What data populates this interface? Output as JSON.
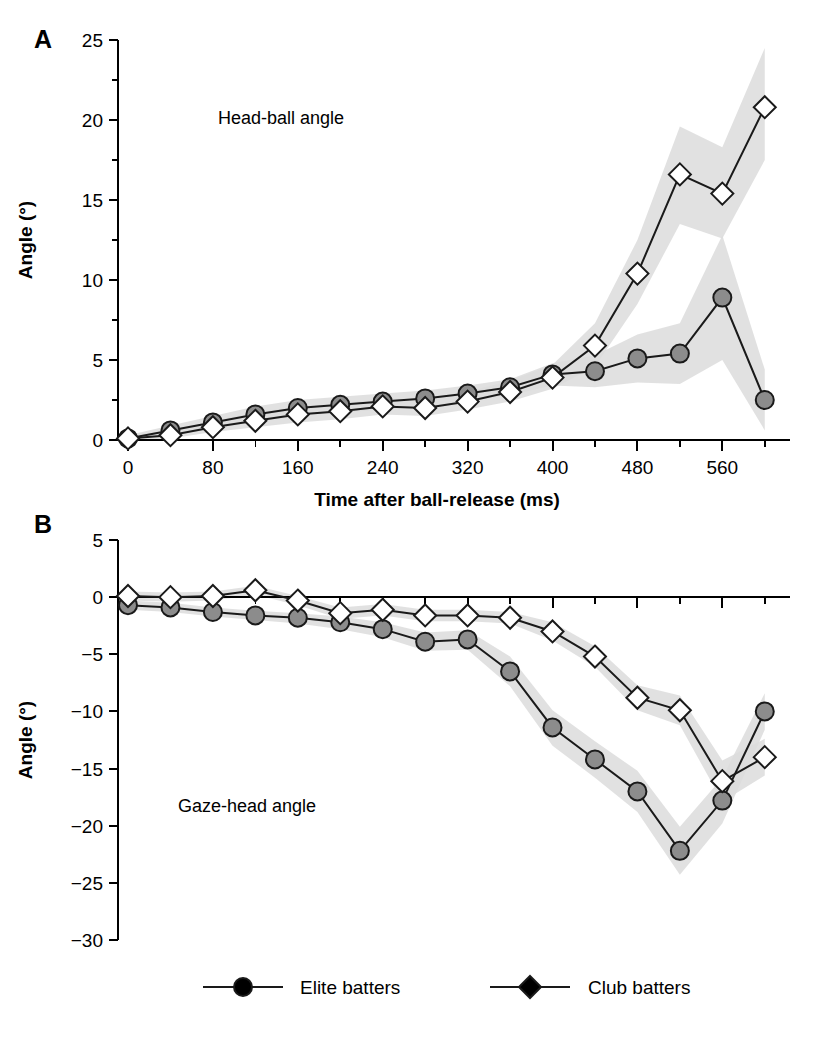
{
  "figure": {
    "panels": [
      {
        "letter": "A",
        "annotation": "Head-ball angle",
        "ylabel": "Angle (°)"
      },
      {
        "letter": "B",
        "annotation": "Gaze-head angle",
        "ylabel": "Angle (°)"
      }
    ],
    "xlabel": "Time after ball-release (ms)",
    "legend": [
      {
        "label": "Elite batters",
        "marker": "filled-circle",
        "color": "#8c8c8c"
      },
      {
        "label": "Club batters",
        "marker": "open-diamond",
        "color": "#ffffff"
      }
    ],
    "colors": {
      "line": "#1a1a1a",
      "elite_fill": "#8c8c8c",
      "club_fill": "#ffffff",
      "band": "#dcdcdc",
      "text": "#000000"
    }
  },
  "chart_data": [
    {
      "type": "line",
      "panel": "A",
      "title": "Head-ball angle",
      "xlabel": "Time after ball-release (ms)",
      "ylabel": "Angle (°)",
      "xlim": [
        0,
        620
      ],
      "ylim": [
        0,
        25
      ],
      "xticks": [
        0,
        80,
        160,
        240,
        320,
        400,
        480,
        560
      ],
      "xtick_labels": [
        "0",
        "80",
        "160",
        "240",
        "320",
        "400",
        "480",
        "560"
      ],
      "xtick_minor_step": 40,
      "yticks": [
        0,
        5,
        10,
        15,
        20,
        25
      ],
      "ytick_labels": [
        "0",
        "5",
        "10",
        "15",
        "20",
        "25"
      ],
      "ytick_minor_step": 2.5,
      "grid": false,
      "legend_position": "bottom-outside",
      "x": [
        0,
        40,
        80,
        120,
        160,
        200,
        240,
        280,
        320,
        360,
        400,
        440,
        480,
        520,
        560,
        600
      ],
      "series": [
        {
          "name": "Elite batters",
          "marker": "filled-circle",
          "values": [
            0.1,
            0.6,
            1.1,
            1.6,
            2.0,
            2.2,
            2.4,
            2.6,
            2.9,
            3.3,
            4.1,
            4.3,
            5.1,
            5.4,
            8.9,
            2.5
          ],
          "band_lower": [
            0.0,
            0.3,
            0.7,
            1.1,
            1.5,
            1.7,
            1.9,
            2.1,
            2.4,
            2.8,
            3.4,
            3.3,
            3.6,
            3.5,
            5.0,
            0.6
          ],
          "band_upper": [
            0.3,
            0.9,
            1.5,
            2.1,
            2.5,
            2.7,
            2.9,
            3.1,
            3.4,
            3.8,
            4.8,
            5.3,
            6.6,
            7.3,
            12.8,
            4.4
          ]
        },
        {
          "name": "Club batters",
          "marker": "open-diamond",
          "values": [
            0.1,
            0.3,
            0.8,
            1.2,
            1.6,
            1.8,
            2.1,
            2.0,
            2.4,
            3.0,
            3.9,
            5.9,
            10.4,
            16.6,
            15.4,
            20.8
          ],
          "band_lower": [
            0.0,
            0.1,
            0.5,
            0.8,
            1.1,
            1.3,
            1.6,
            1.5,
            1.9,
            2.4,
            3.2,
            4.6,
            8.5,
            13.5,
            12.6,
            17.5
          ],
          "band_upper": [
            0.3,
            0.6,
            1.2,
            1.7,
            2.1,
            2.3,
            2.6,
            2.6,
            3.0,
            3.7,
            4.7,
            7.3,
            12.5,
            19.6,
            18.3,
            24.5
          ]
        }
      ]
    },
    {
      "type": "line",
      "panel": "B",
      "title": "Gaze-head angle",
      "xlabel": "Time after ball-release (ms)",
      "ylabel": "Angle (°)",
      "xlim": [
        0,
        620
      ],
      "ylim": [
        -30,
        5
      ],
      "xticks": [
        0,
        80,
        160,
        240,
        320,
        400,
        480,
        560
      ],
      "xtick_labels": [
        "0",
        "80",
        "160",
        "240",
        "320",
        "400",
        "480",
        "560"
      ],
      "xtick_minor_step": 40,
      "yticks": [
        5,
        0,
        -5,
        -10,
        -15,
        -20,
        -25,
        -30
      ],
      "ytick_labels": [
        "5",
        "0",
        "−5",
        "−10",
        "−15",
        "−20",
        "−25",
        "−30"
      ],
      "grid": false,
      "legend_position": "bottom-outside",
      "x": [
        0,
        40,
        80,
        120,
        160,
        200,
        240,
        280,
        320,
        360,
        400,
        440,
        480,
        520,
        560,
        600
      ],
      "series": [
        {
          "name": "Elite batters",
          "marker": "filled-circle",
          "values": [
            -0.7,
            -0.9,
            -1.3,
            -1.6,
            -1.8,
            -2.2,
            -2.8,
            -3.9,
            -3.7,
            -6.5,
            -11.4,
            -14.2,
            -17.0,
            -22.2,
            -17.8,
            -10.0
          ],
          "band_lower": [
            -1.1,
            -1.3,
            -1.7,
            -2.0,
            -2.3,
            -2.8,
            -3.5,
            -4.7,
            -4.6,
            -7.8,
            -13.0,
            -15.8,
            -18.8,
            -24.3,
            -19.8,
            -11.6
          ],
          "band_upper": [
            -0.3,
            -0.5,
            -0.9,
            -1.2,
            -1.4,
            -1.7,
            -2.2,
            -3.1,
            -2.9,
            -5.2,
            -9.9,
            -12.6,
            -15.2,
            -20.1,
            -15.8,
            -8.4
          ]
        },
        {
          "name": "Club batters",
          "marker": "open-diamond",
          "values": [
            0.1,
            0.0,
            0.1,
            0.6,
            -0.3,
            -1.4,
            -1.1,
            -1.6,
            -1.6,
            -1.8,
            -3.0,
            -5.2,
            -8.8,
            -9.9,
            -16.1,
            -14.0
          ],
          "band_lower": [
            -0.3,
            -0.4,
            -0.3,
            0.2,
            -0.7,
            -1.9,
            -1.6,
            -2.1,
            -2.1,
            -2.3,
            -3.8,
            -6.1,
            -9.9,
            -11.2,
            -17.9,
            -15.6
          ],
          "band_upper": [
            0.5,
            0.4,
            0.5,
            1.0,
            0.1,
            -0.9,
            -0.6,
            -1.1,
            -1.1,
            -1.3,
            -2.2,
            -4.3,
            -7.7,
            -8.6,
            -14.3,
            -12.4
          ]
        }
      ]
    }
  ]
}
